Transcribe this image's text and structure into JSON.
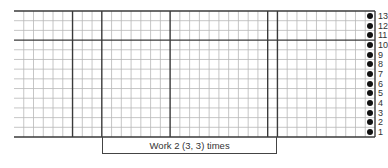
{
  "chart": {
    "type": "knitting-chart",
    "columns": 37,
    "rows": 13,
    "row_labels": [
      "1",
      "2",
      "3",
      "4",
      "5",
      "6",
      "7",
      "8",
      "9",
      "10",
      "11",
      "12",
      "13"
    ],
    "heavy_vertical_after_columns": [
      6,
      9,
      16,
      26,
      27
    ],
    "heavy_horizontal_after_rows": [
      10
    ],
    "dot_column": 37,
    "dot_rows": [
      1,
      2,
      3,
      4,
      5,
      6,
      7,
      8,
      9,
      10,
      11,
      12,
      13
    ],
    "repeat": {
      "label": "Work 2 (3, 3) times",
      "from_column": 10,
      "to_column": 27
    },
    "colors": {
      "grid_light": "#b8b8b8",
      "grid_heavy": "#3a3a3a",
      "dot": "#111111",
      "text": "#333333"
    }
  }
}
